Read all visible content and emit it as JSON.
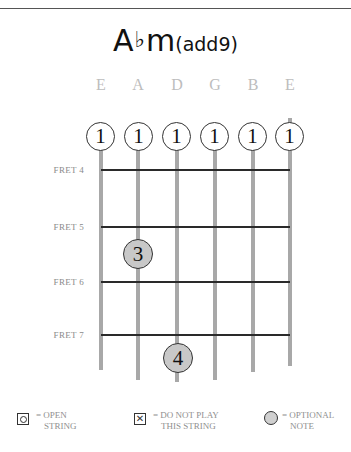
{
  "chord": {
    "root": "A",
    "accidental": "♭",
    "quality": "m",
    "extension": "(add9)",
    "full_name": "A♭m(add9)"
  },
  "strings": [
    {
      "name": "E",
      "x": 101
    },
    {
      "name": "A",
      "x": 138
    },
    {
      "name": "D",
      "x": 177
    },
    {
      "name": "G",
      "x": 215
    },
    {
      "name": "B",
      "x": 253
    },
    {
      "name": "E",
      "x": 290
    }
  ],
  "frets": [
    {
      "label": "FRET 4",
      "y": 170
    },
    {
      "label": "FRET 5",
      "y": 227
    },
    {
      "label": "FRET 6",
      "y": 282
    },
    {
      "label": "FRET 7",
      "y": 335
    }
  ],
  "barre_fingers": [
    {
      "string": "E",
      "finger": "1"
    },
    {
      "string": "A",
      "finger": "1"
    },
    {
      "string": "D",
      "finger": "1"
    },
    {
      "string": "G",
      "finger": "1"
    },
    {
      "string": "B",
      "finger": "1"
    },
    {
      "string": "E",
      "finger": "1"
    }
  ],
  "fretted_notes": [
    {
      "string": "A",
      "fret": 5,
      "finger": "3"
    },
    {
      "string": "D",
      "fret": 7,
      "finger": "4"
    }
  ],
  "legend": {
    "open": {
      "symbol": "open-string-icon",
      "line1": "= OPEN",
      "line2": "STRING"
    },
    "muted": {
      "symbol": "muted-string-icon",
      "line1": "= DO NOT PLAY",
      "line2": "THIS STRING"
    },
    "optional": {
      "symbol": "optional-note-icon",
      "line1": "= OPTIONAL",
      "line2": "NOTE"
    }
  },
  "colors": {
    "string": "#a8a8a8",
    "fret": "#2a2a2a",
    "fretted_note_fill": "#c8c8c8",
    "label_gray": "#8a8a8a",
    "string_name_gray": "#bdbdbd"
  }
}
